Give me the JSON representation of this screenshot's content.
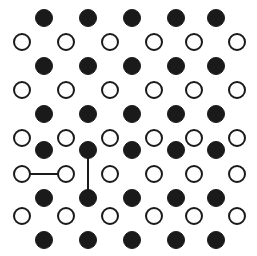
{
  "figure": {
    "width": 257,
    "height": 256,
    "background_color": "#ffffff"
  },
  "chart_data": {
    "type": "scatter",
    "title": "",
    "subtitle": "",
    "xlabel": "",
    "ylabel": "",
    "xlim": [
      0,
      257
    ],
    "ylim": [
      0,
      256
    ],
    "grid": false,
    "legend_position": "none",
    "axes_visible": false,
    "tick_labels_x": [],
    "tick_labels_y": [],
    "annotations": [],
    "series": [
      {
        "name": "filled-site",
        "marker": "circle-filled",
        "fill_color": "#1a1a1a",
        "stroke_color": "#1a1a1a",
        "stroke_width": 1,
        "radius": 8.5,
        "count": 30,
        "points": [
          {
            "x": 44,
            "y": 18
          },
          {
            "x": 88,
            "y": 18
          },
          {
            "x": 132,
            "y": 18
          },
          {
            "x": 176,
            "y": 18
          },
          {
            "x": 216,
            "y": 18
          },
          {
            "x": 44,
            "y": 66
          },
          {
            "x": 88,
            "y": 66
          },
          {
            "x": 132,
            "y": 66
          },
          {
            "x": 176,
            "y": 66
          },
          {
            "x": 216,
            "y": 66
          },
          {
            "x": 44,
            "y": 114
          },
          {
            "x": 88,
            "y": 114
          },
          {
            "x": 132,
            "y": 114
          },
          {
            "x": 176,
            "y": 114
          },
          {
            "x": 216,
            "y": 114
          },
          {
            "x": 44,
            "y": 150
          },
          {
            "x": 88,
            "y": 150
          },
          {
            "x": 132,
            "y": 150
          },
          {
            "x": 176,
            "y": 150
          },
          {
            "x": 216,
            "y": 150
          },
          {
            "x": 44,
            "y": 198
          },
          {
            "x": 88,
            "y": 198
          },
          {
            "x": 132,
            "y": 198
          },
          {
            "x": 176,
            "y": 198
          },
          {
            "x": 216,
            "y": 198
          },
          {
            "x": 44,
            "y": 240
          },
          {
            "x": 88,
            "y": 240
          },
          {
            "x": 132,
            "y": 240
          },
          {
            "x": 176,
            "y": 240
          },
          {
            "x": 216,
            "y": 240
          }
        ]
      },
      {
        "name": "open-site",
        "marker": "circle-open",
        "fill_color": "#ffffff",
        "stroke_color": "#1a1a1a",
        "stroke_width": 2,
        "radius": 8,
        "count": 30,
        "points": [
          {
            "x": 22,
            "y": 42
          },
          {
            "x": 66,
            "y": 42
          },
          {
            "x": 110,
            "y": 42
          },
          {
            "x": 154,
            "y": 42
          },
          {
            "x": 194,
            "y": 42
          },
          {
            "x": 237,
            "y": 42
          },
          {
            "x": 22,
            "y": 90
          },
          {
            "x": 66,
            "y": 90
          },
          {
            "x": 110,
            "y": 90
          },
          {
            "x": 154,
            "y": 90
          },
          {
            "x": 194,
            "y": 90
          },
          {
            "x": 237,
            "y": 90
          },
          {
            "x": 22,
            "y": 138
          },
          {
            "x": 66,
            "y": 138
          },
          {
            "x": 110,
            "y": 138
          },
          {
            "x": 154,
            "y": 138
          },
          {
            "x": 194,
            "y": 138
          },
          {
            "x": 237,
            "y": 138
          },
          {
            "x": 22,
            "y": 174
          },
          {
            "x": 66,
            "y": 174
          },
          {
            "x": 110,
            "y": 174
          },
          {
            "x": 154,
            "y": 174
          },
          {
            "x": 194,
            "y": 174
          },
          {
            "x": 237,
            "y": 174
          },
          {
            "x": 22,
            "y": 216
          },
          {
            "x": 66,
            "y": 216
          },
          {
            "x": 110,
            "y": 216
          },
          {
            "x": 154,
            "y": 216
          },
          {
            "x": 194,
            "y": 216
          },
          {
            "x": 237,
            "y": 216
          }
        ]
      }
    ],
    "bonds": [
      {
        "name": "horizontal-bond",
        "orientation": "horizontal",
        "connects": "open-site",
        "x1": 22,
        "y1": 174,
        "x2": 66,
        "y2": 174,
        "stroke_color": "#1a1a1a",
        "stroke_width": 2
      },
      {
        "name": "vertical-bond",
        "orientation": "vertical",
        "connects": "filled-site",
        "x1": 88,
        "y1": 150,
        "x2": 88,
        "y2": 198,
        "stroke_color": "#1a1a1a",
        "stroke_width": 2
      }
    ]
  }
}
